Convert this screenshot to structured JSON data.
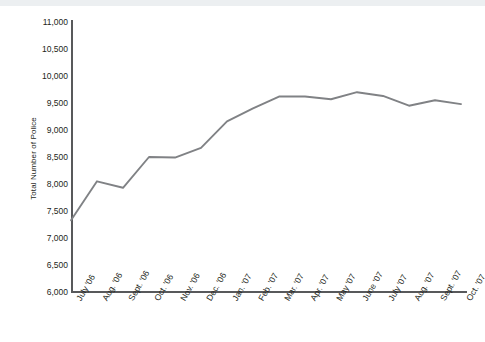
{
  "figure": {
    "background_color": "#ffffff",
    "top_bar_color": "#eceff1",
    "axis_color": "#58595b",
    "line_color": "#808285",
    "text_color": "#231f20"
  },
  "chart_data": {
    "type": "line",
    "title": "",
    "xlabel": "",
    "ylabel": "Total Number of Police",
    "ylim": [
      6000,
      11000
    ],
    "ytick_labels": [
      "11,000",
      "10,500",
      "10,000",
      "9,500",
      "9,000",
      "8,500",
      "8,000",
      "7,500",
      "7,000",
      "6,500",
      "6,000"
    ],
    "ytick_values": [
      11000,
      10500,
      10000,
      9500,
      9000,
      8500,
      8000,
      7500,
      7000,
      6500,
      6000
    ],
    "grid": false,
    "legend": false,
    "categories": [
      "July '06",
      "Aug. '06",
      "Sept. '06",
      "Oct. '06",
      "Nov. '06",
      "Dec. '06",
      "Jan. '07",
      "Feb. '07",
      "Mar. '07",
      "Apr. '07",
      "May '07",
      "June '07",
      "July '07",
      "Aug. '07",
      "Sept. '07",
      "Oct. '07"
    ],
    "series": [
      {
        "name": "Total Number of Police",
        "values": [
          7330,
          8050,
          7930,
          8500,
          8490,
          8670,
          9160,
          9400,
          9620,
          9620,
          9570,
          9700,
          9630,
          9450,
          9550,
          9480
        ]
      }
    ]
  }
}
